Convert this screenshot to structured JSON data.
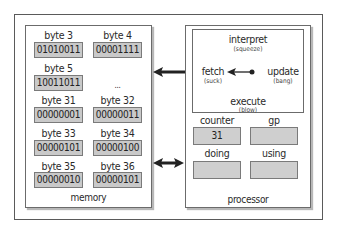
{
  "memory": {
    "label": "memory",
    "cells": [
      {
        "label": "byte 3",
        "value": "01010011"
      },
      {
        "label": "byte 4",
        "value": "00001111"
      },
      {
        "label": "byte 5",
        "value": "10011011"
      },
      {
        "label": "byte 31",
        "value": "00000001"
      },
      {
        "label": "byte 32",
        "value": "00000011"
      },
      {
        "label": "byte 33",
        "value": "00000101"
      },
      {
        "label": "byte 34",
        "value": "00000100"
      },
      {
        "label": "byte 35",
        "value": "00000010"
      },
      {
        "label": "byte 36",
        "value": "00000101"
      }
    ],
    "ellipsis": "..."
  },
  "processor": {
    "label": "processor",
    "cycle": {
      "interpret": {
        "label": "interpret",
        "alias": "(squeeze)"
      },
      "fetch": {
        "label": "fetch",
        "alias": "(suck)"
      },
      "update": {
        "label": "update",
        "alias": "(bang)"
      },
      "execute": {
        "label": "execute",
        "alias": "(blow)"
      }
    },
    "registers": {
      "counter": {
        "label": "counter",
        "value": "31"
      },
      "gp": {
        "label": "gp",
        "value": ""
      },
      "doing": {
        "label": "doing",
        "value": ""
      },
      "using": {
        "label": "using",
        "value": ""
      }
    }
  },
  "colors": {
    "cell_fill": "#c9c9c9",
    "border": "#6b6b6b",
    "arrow": "#222222"
  }
}
